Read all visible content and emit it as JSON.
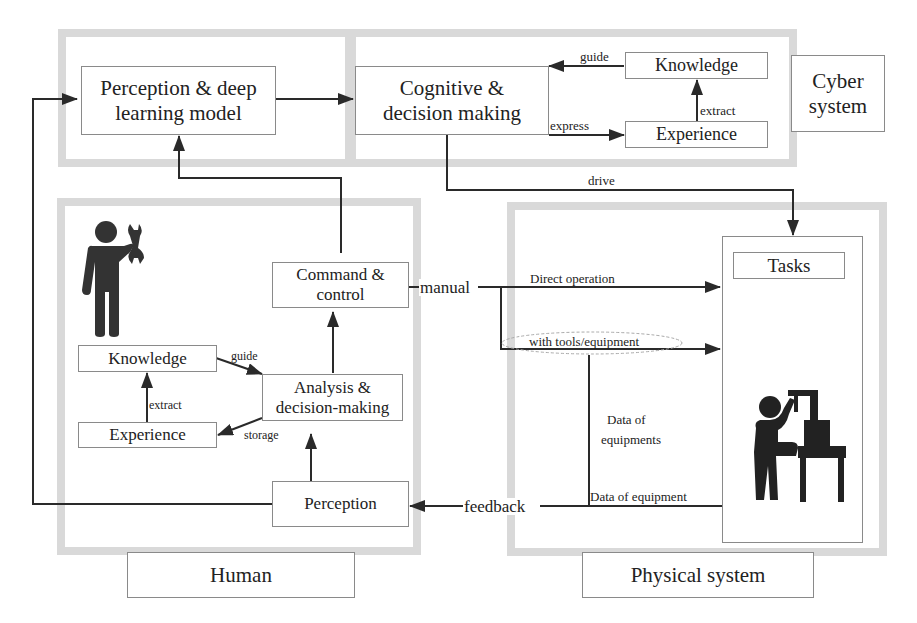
{
  "regions": {
    "cyber": {
      "label": "Cyber\nsystem",
      "line1": "Cyber",
      "line2": "system"
    },
    "human": {
      "label": "Human"
    },
    "physical": {
      "label": "Physical system"
    }
  },
  "nodes": {
    "perception_dl": {
      "line1": "Perception & deep",
      "line2": "learning model"
    },
    "cognitive": {
      "line1": "Cognitive &",
      "line2": "decision making"
    },
    "cyber_knowledge": {
      "label": "Knowledge"
    },
    "cyber_experience": {
      "label": "Experience"
    },
    "command": {
      "line1": "Command &",
      "line2": "control"
    },
    "human_knowledge": {
      "label": "Knowledge"
    },
    "human_experience": {
      "label": "Experience"
    },
    "analysis": {
      "line1": "Analysis &",
      "line2": "decision-making"
    },
    "perception": {
      "label": "Perception"
    },
    "tasks": {
      "label": "Tasks"
    }
  },
  "edge_labels": {
    "cyber_guide": "guide",
    "cyber_extract": "extract",
    "cyber_express": "express",
    "drive": "drive",
    "manual": "manual",
    "direct_operation": "Direct operation",
    "with_tools": "with tools/equipment",
    "data_of_equipments_1": "Data of",
    "data_of_equipments_2": "equipments",
    "data_of_equipment": "Data of equipment",
    "feedback": "feedback",
    "human_guide": "guide",
    "human_extract": "extract",
    "human_storage": "storage"
  },
  "icons": {
    "worker": "person-with-wrench-icon",
    "operator": "person-operating-machine-icon"
  },
  "colors": {
    "region_border": "#d9d9d9",
    "box_border": "#8a8a8a",
    "line": "#2a2a2a",
    "icon_fill": "#222222"
  }
}
